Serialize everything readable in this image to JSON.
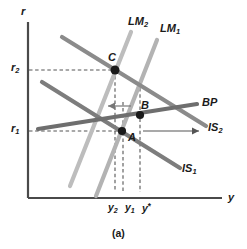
{
  "figure": {
    "caption": "(a)",
    "axes": {
      "y_axis_label": "y",
      "r_axis_label": "r"
    },
    "tick_labels": {
      "r2": "r",
      "r2_sub": "2",
      "r1": "r",
      "r1_sub": "1",
      "y2": "y",
      "y2_sub": "2",
      "y1": "y",
      "y1_sub": "1",
      "ystar": "y",
      "ystar_sup": "*"
    },
    "curves": [
      {
        "name": "LM2",
        "base": "LM",
        "sub": "2",
        "color": "#b9b9b9"
      },
      {
        "name": "LM1",
        "base": "LM",
        "sub": "1",
        "color": "#b0b0b0"
      },
      {
        "name": "IS1",
        "base": "IS",
        "sub": "1",
        "color": "#7a7a7a"
      },
      {
        "name": "IS2",
        "base": "IS",
        "sub": "2",
        "color": "#8a8a8a"
      },
      {
        "name": "BP",
        "base": "BP",
        "sub": "",
        "color": "#6e6e6e"
      }
    ],
    "points": [
      {
        "label": "A",
        "x": 122,
        "y": 131
      },
      {
        "label": "B",
        "x": 140,
        "y": 115
      },
      {
        "label": "C",
        "x": 115,
        "y": 70
      }
    ],
    "annotations": {
      "lm_shift_arrow": "left-arrow",
      "is_shift_arrow": "right-arrow"
    }
  },
  "colors": {
    "axis": "#4a4a4a",
    "point": "#1a1a1a",
    "dash": "#555555",
    "lm": "#b5b5b5",
    "is": "#828282",
    "bp": "#6e6e6e"
  }
}
